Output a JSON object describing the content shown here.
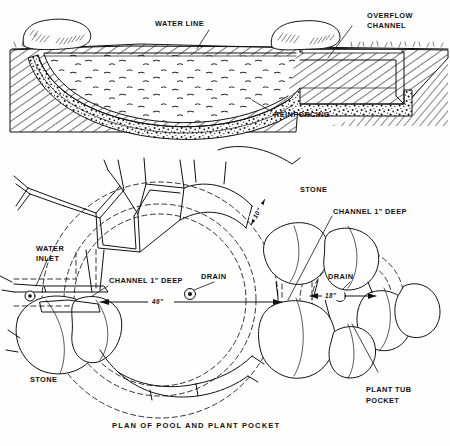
{
  "figure": {
    "caption": "PLAN OF POOL AND PLANT POCKET",
    "ink_color": "#111111",
    "paper_color": "#fefefe"
  },
  "section_view": {
    "name": "cross-section-of-pool",
    "labels": {
      "water_line": "WATER LINE",
      "overflow_channel_l1": "OVERFLOW",
      "overflow_channel_l2": "CHANNEL",
      "reinforcing": "REINFORCING"
    },
    "elements": {
      "soil": "hatched-earth-fill",
      "shell": "stippled-concrete-shell",
      "water": "pool-water-surface",
      "coping_stone_left": "coping-stone",
      "coping_stone_right": "coping-stone"
    }
  },
  "plan_view": {
    "name": "plan-of-pool-and-plant-pocket",
    "labels": {
      "stone_top": "STONE",
      "stone_bottom": "STONE",
      "water_inlet_l1": "WATER",
      "water_inlet_l2": "INLET",
      "channel_left": "CHANNEL 1\" DEEP",
      "channel_right": "CHANNEL 1\" DEEP",
      "drain_left": "DRAIN",
      "drain_right": "DRAIN",
      "plant_tub_l1": "PLANT  TUB",
      "plant_tub_l2": "POCKET"
    },
    "dimensions": [
      {
        "name": "pool-diameter",
        "value": "46\""
      },
      {
        "name": "plant-pocket-width",
        "value": "18\""
      },
      {
        "name": "coping-width",
        "value": "10\""
      }
    ]
  }
}
